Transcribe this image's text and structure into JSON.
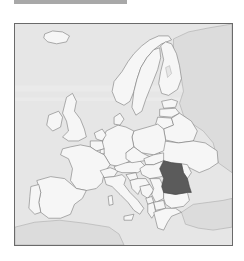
{
  "header": {
    "bar_color": "#a8a8a8"
  },
  "map": {
    "title": "Map of Europe",
    "highlighted_country": "Romania",
    "colors": {
      "highlight": "#5b5b5b",
      "land": "#f6f6f6",
      "sea": "#e6e6e6",
      "non_member_land": "#dcdcdc",
      "border": "#6f6f6f",
      "frame": "#6a6a6a"
    },
    "countries": [
      "Iceland",
      "Norway",
      "Sweden",
      "Finland",
      "Russia",
      "Estonia",
      "Latvia",
      "Lithuania",
      "Belarus",
      "Ukraine",
      "Moldova",
      "Poland",
      "Germany",
      "Denmark",
      "Netherlands",
      "Belgium",
      "Luxembourg",
      "France",
      "Spain",
      "Portugal",
      "United Kingdom",
      "Ireland",
      "Switzerland",
      "Austria",
      "Czech Republic",
      "Slovakia",
      "Hungary",
      "Slovenia",
      "Croatia",
      "Bosnia and Herzegovina",
      "Serbia",
      "Montenegro",
      "Albania",
      "North Macedonia",
      "Bulgaria",
      "Greece",
      "Turkey",
      "Italy",
      "Romania",
      "North Africa"
    ]
  }
}
